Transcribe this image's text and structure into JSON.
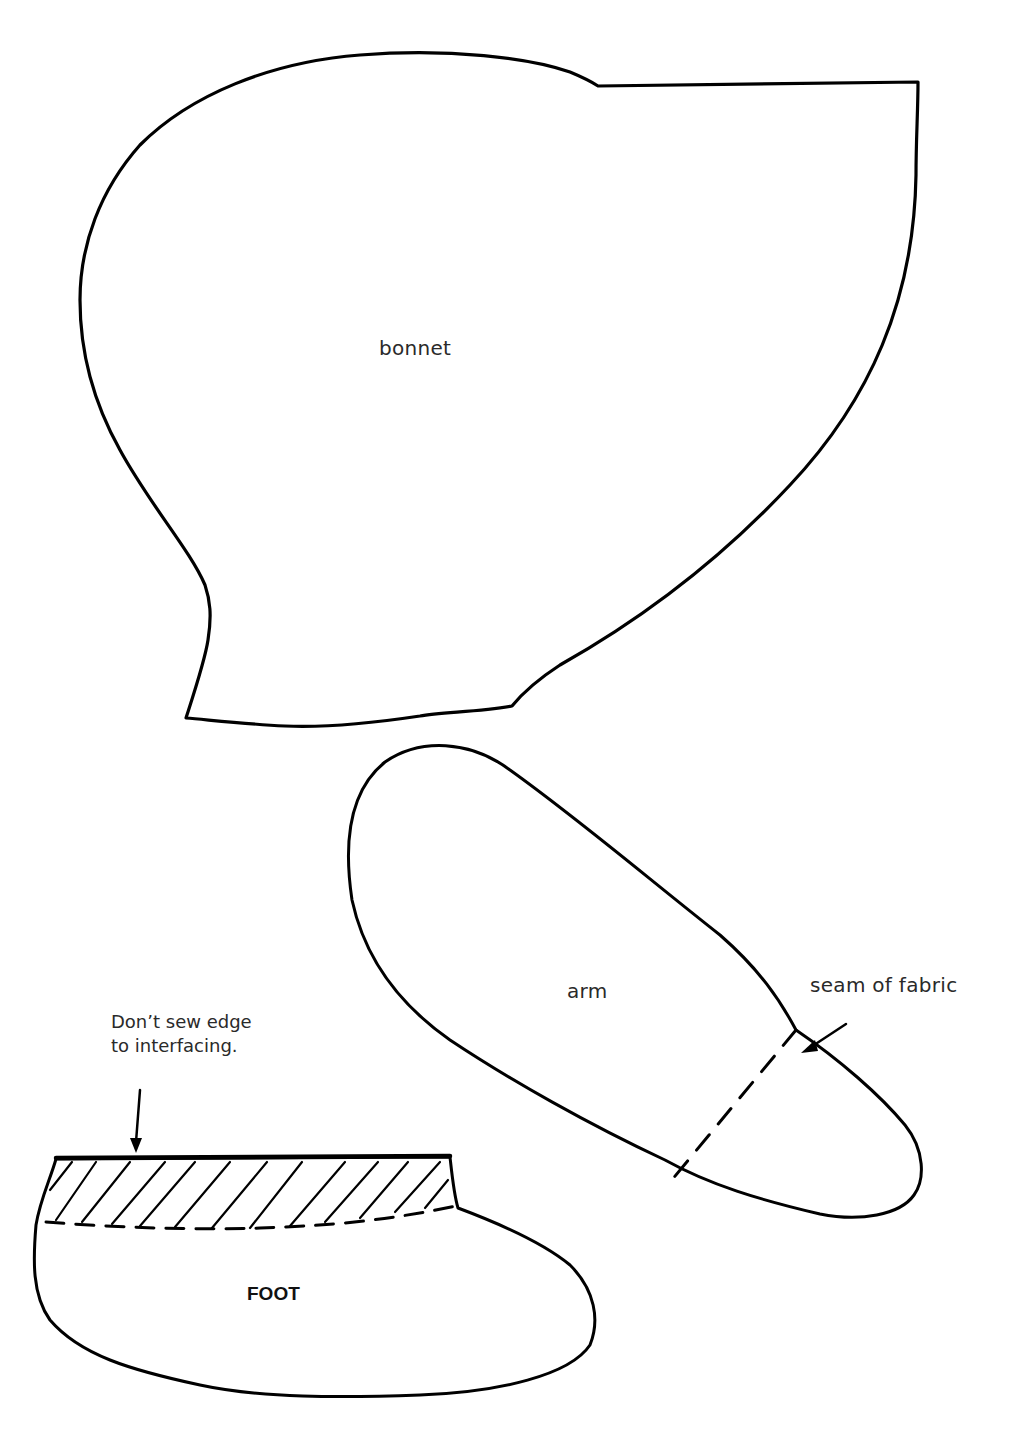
{
  "diagram": {
    "type": "sewing-pattern",
    "ink_color": "#000000",
    "background": "#ffffff",
    "pieces": [
      {
        "id": "bonnet",
        "label": "bonnet"
      },
      {
        "id": "arm",
        "label": "arm"
      },
      {
        "id": "foot",
        "label": "FOOT"
      }
    ],
    "annotations": {
      "seam": {
        "text": "seam of fabric",
        "points_to": "arm"
      },
      "interfacing": {
        "line1": "Don’t sew edge",
        "line2": "to interfacing.",
        "points_to": "foot"
      }
    },
    "line_styles": {
      "cut_line": "solid",
      "seam_line": "dashed",
      "interfacing_area": "hatched"
    }
  }
}
